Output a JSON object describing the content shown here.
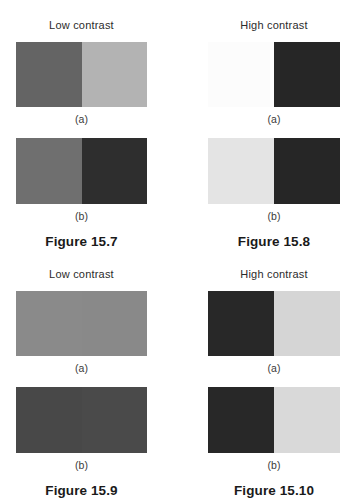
{
  "page": {
    "background_color": "#ffffff",
    "header_text_color": "#2b2b2b",
    "caption_text_color": "#1a1a1a"
  },
  "figures": [
    {
      "header": "Low contrast",
      "caption": "Figure 15.7",
      "panels": [
        {
          "label": "(a)",
          "left_color": "#646464",
          "right_color": "#b3b3b3"
        },
        {
          "label": "(b)",
          "left_color": "#6f6f6f",
          "right_color": "#2e2e2e"
        }
      ]
    },
    {
      "header": "High contrast",
      "caption": "Figure 15.8",
      "panels": [
        {
          "label": "(a)",
          "left_color": "#fcfcfc",
          "right_color": "#262626"
        },
        {
          "label": "(b)",
          "left_color": "#e4e4e4",
          "right_color": "#262626"
        }
      ]
    },
    {
      "header": "Low contrast",
      "caption": "Figure 15.9",
      "panels": [
        {
          "label": "(a)",
          "left_color": "#8a8a8a",
          "right_color": "#898989"
        },
        {
          "label": "(b)",
          "left_color": "#484848",
          "right_color": "#4a4a4a"
        }
      ]
    },
    {
      "header": "High contrast",
      "caption": "Figure 15.10",
      "panels": [
        {
          "label": "(a)",
          "left_color": "#282828",
          "right_color": "#d5d5d5"
        },
        {
          "label": "(b)",
          "left_color": "#282828",
          "right_color": "#d9d9d9"
        }
      ]
    }
  ]
}
